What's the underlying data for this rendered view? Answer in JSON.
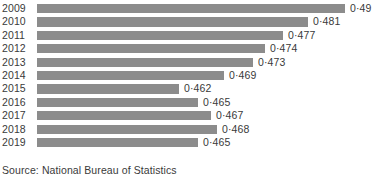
{
  "source_note": "Source: National Bureau of Statistics",
  "colors": {
    "bar": "#8c8c8c",
    "text": "#3a3a3a",
    "background": "#ffffff"
  },
  "chart_data": {
    "type": "bar",
    "orientation": "horizontal",
    "title": "",
    "subtitle": "",
    "xlabel": "",
    "ylabel": "",
    "grid": false,
    "legend": false,
    "axis_visible": false,
    "value_labels": true,
    "decimal_separator": "·",
    "xlim": [
      0.4555,
      0.4915
    ],
    "categories": [
      "2009",
      "2010",
      "2011",
      "2012",
      "2013",
      "2014",
      "2015",
      "2016",
      "2017",
      "2018",
      "2019"
    ],
    "values": [
      0.49,
      0.481,
      0.477,
      0.474,
      0.473,
      0.469,
      0.462,
      0.465,
      0.467,
      0.468,
      0.465
    ],
    "value_text": [
      "0·49",
      "0·481",
      "0·477",
      "0·474",
      "0·473",
      "0·469",
      "0·462",
      "0·465",
      "0·467",
      "0·468",
      "0·465"
    ],
    "rows": [
      {
        "year": "2009",
        "value": 0.49,
        "label": "0·49",
        "bar_px": 308
      },
      {
        "year": "2010",
        "value": 0.481,
        "label": "0·481",
        "bar_px": 271
      },
      {
        "year": "2011",
        "value": 0.477,
        "label": "0·477",
        "bar_px": 246
      },
      {
        "year": "2012",
        "value": 0.474,
        "label": "0·474",
        "bar_px": 228
      },
      {
        "year": "2013",
        "value": 0.473,
        "label": "0·473",
        "bar_px": 216
      },
      {
        "year": "2014",
        "value": 0.469,
        "label": "0·469",
        "bar_px": 187
      },
      {
        "year": "2015",
        "value": 0.462,
        "label": "0·462",
        "bar_px": 142
      },
      {
        "year": "2016",
        "value": 0.465,
        "label": "0·465",
        "bar_px": 161
      },
      {
        "year": "2017",
        "value": 0.467,
        "label": "0·467",
        "bar_px": 174
      },
      {
        "year": "2018",
        "value": 0.468,
        "label": "0·468",
        "bar_px": 180
      },
      {
        "year": "2019",
        "value": 0.465,
        "label": "0·465",
        "bar_px": 161
      }
    ]
  }
}
